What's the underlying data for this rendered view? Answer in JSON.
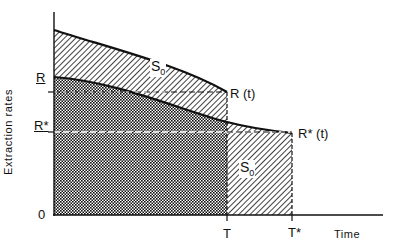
{
  "diagram": {
    "y_axis_label": "Extraction rates",
    "x_axis_label": "Time",
    "y_ticks": {
      "R": "R",
      "R_star": "R*",
      "zero": "0"
    },
    "x_ticks": {
      "T": "T",
      "T_star": "T*"
    },
    "curve_labels": {
      "R_t": "R (t)",
      "R_star_t": "R* (t)"
    },
    "region_labels": {
      "upper_area": "S",
      "upper_area_sub": "0",
      "right_area": "S",
      "right_area_sub": "0"
    },
    "colors": {
      "ink": "#111111",
      "background": "#ffffff"
    }
  }
}
